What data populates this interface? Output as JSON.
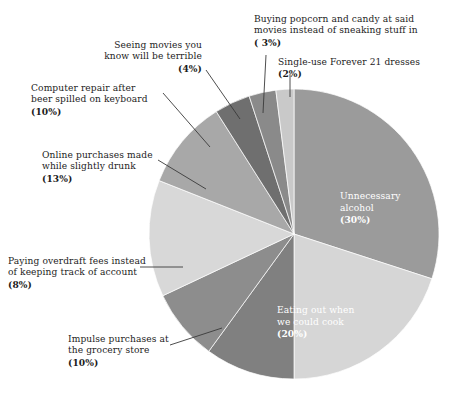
{
  "chart_data": {
    "type": "pie",
    "title": "",
    "subtitle": "",
    "xlabel": "",
    "ylabel": "",
    "legend_position": "none",
    "grid": false,
    "units": "percent",
    "start_angle_deg": 0,
    "direction": "clockwise",
    "categories": [
      "Unnecessary alcohol",
      "Eating out when we could cook",
      "Impulse purchases at the grocery store",
      "Paying overdraft fees instead of keeping track of account",
      "Online purchases made while slightly drunk",
      "Computer repair after beer spilled on keyboard",
      "Seeing movies you know will be terrible",
      "Buying popcorn and candy at said movies instead of sneaking stuff in",
      "Single-use Forever 21 dresses"
    ],
    "values": [
      30,
      20,
      10,
      8,
      13,
      10,
      4,
      3,
      2
    ],
    "colors": [
      "#9b9b9b",
      "#d6d6d6",
      "#808080",
      "#8d8d8d",
      "#d8d8d8",
      "#a8a8a8",
      "#6f6f6f",
      "#8a8a8a",
      "#c9c9c9"
    ]
  },
  "slices": [
    {
      "id": "unnecessary-alcohol",
      "name_lines": [
        "Unnecessary",
        "alcohol"
      ],
      "percent_label": "(30%)",
      "value": 30,
      "color": "#9b9b9b",
      "label_placement": "inside",
      "label_color": "#ffffff"
    },
    {
      "id": "eating-out",
      "name_lines": [
        "Eating out when",
        "we could cook"
      ],
      "percent_label": "(20%)",
      "value": 20,
      "color": "#d6d6d6",
      "label_placement": "inside",
      "label_color": "#ffffff"
    },
    {
      "id": "impulse-purchases",
      "name_lines": [
        "Impulse purchases at",
        "the grocery store"
      ],
      "percent_label": "(10%)",
      "value": 10,
      "color": "#808080",
      "label_placement": "outside-left",
      "label_color": "#1c1c1c"
    },
    {
      "id": "overdraft-fees",
      "name_lines": [
        "Paying overdraft fees instead",
        "of keeping track of account"
      ],
      "percent_label": "(8%)",
      "value": 8,
      "color": "#8d8d8d",
      "label_placement": "outside-left",
      "label_color": "#1c1c1c"
    },
    {
      "id": "online-purchases",
      "name_lines": [
        "Online purchases made",
        "while slightly drunk"
      ],
      "percent_label": "(13%)",
      "value": 13,
      "color": "#d8d8d8",
      "label_placement": "outside-left",
      "label_color": "#1c1c1c"
    },
    {
      "id": "computer-repair",
      "name_lines": [
        "Computer repair after",
        "beer spilled on keyboard"
      ],
      "percent_label": "(10%)",
      "value": 10,
      "color": "#a8a8a8",
      "label_placement": "outside-left",
      "label_color": "#1c1c1c"
    },
    {
      "id": "seeing-movies",
      "name_lines": [
        "Seeing movies you",
        "know will be terrible"
      ],
      "percent_label": "(4%)",
      "value": 4,
      "color": "#6f6f6f",
      "label_placement": "outside-top",
      "label_color": "#1c1c1c"
    },
    {
      "id": "buying-popcorn",
      "name_lines": [
        "Buying popcorn and candy at said",
        "movies instead of sneaking stuff in"
      ],
      "percent_label": "( 3%)",
      "value": 3,
      "color": "#8a8a8a",
      "label_placement": "outside-top",
      "label_color": "#1c1c1c"
    },
    {
      "id": "forever-21-dresses",
      "name_lines": [
        "Single-use Forever 21 dresses"
      ],
      "percent_label": "(2%)",
      "value": 2,
      "color": "#c9c9c9",
      "label_placement": "outside-top",
      "label_color": "#1c1c1c"
    }
  ],
  "geometry": {
    "center_x": 294,
    "center_y": 234,
    "radius": 145,
    "leader_color": "#3a3a3a"
  }
}
